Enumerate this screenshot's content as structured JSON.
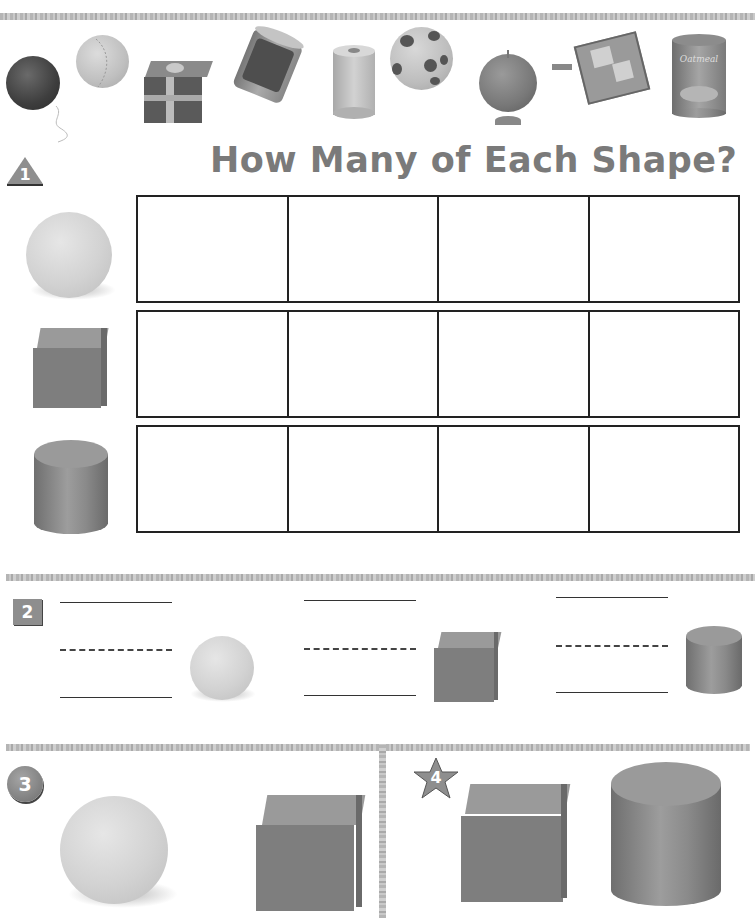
{
  "page": {
    "title": "How Many of Each Shape?"
  },
  "top_objects": [
    {
      "name": "ball-with-string",
      "shape": "sphere"
    },
    {
      "name": "baseball",
      "shape": "sphere"
    },
    {
      "name": "gift-box",
      "shape": "cube"
    },
    {
      "name": "food-can",
      "shape": "cylinder"
    },
    {
      "name": "paper-towel-roll",
      "shape": "cylinder"
    },
    {
      "name": "spotted-ball",
      "shape": "sphere"
    },
    {
      "name": "globe",
      "shape": "sphere"
    },
    {
      "name": "jack-in-the-box",
      "shape": "cube"
    },
    {
      "name": "oatmeal-canister",
      "shape": "cylinder",
      "label": "Oatmeal"
    }
  ],
  "section1": {
    "badge": "1",
    "badge_shape": "triangle",
    "rows": [
      {
        "shape": "sphere",
        "cells": [
          "",
          "",
          "",
          ""
        ]
      },
      {
        "shape": "cube",
        "cells": [
          "",
          "",
          "",
          ""
        ]
      },
      {
        "shape": "cylinder",
        "cells": [
          "",
          "",
          "",
          ""
        ]
      }
    ]
  },
  "section2": {
    "badge": "2",
    "badge_shape": "square",
    "items": [
      {
        "shape": "sphere",
        "answer": ""
      },
      {
        "shape": "cube",
        "answer": ""
      },
      {
        "shape": "cylinder",
        "answer": ""
      }
    ]
  },
  "section3": {
    "badge": "3",
    "badge_shape": "circle",
    "shapes": [
      "sphere",
      "cube"
    ]
  },
  "section4": {
    "badge": "4",
    "badge_shape": "star",
    "shapes": [
      "cube",
      "cylinder"
    ]
  },
  "colors": {
    "title": "#7a7a7a",
    "grid_border": "#222222",
    "badge": "#8a8a8a",
    "band": "#bbbbbb"
  }
}
